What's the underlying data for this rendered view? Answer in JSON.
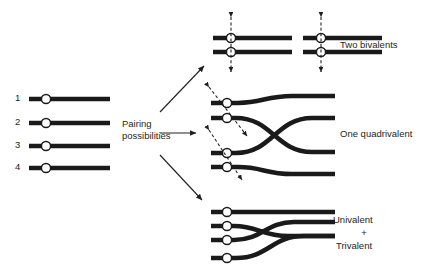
{
  "diagram": {
    "title_text_present": false,
    "background_color": "#ffffff",
    "chromosome_color": "#1a1a1a",
    "centromere_fill": "#ffffff",
    "arrow_color": "#231f20",
    "text_color": "#231f20"
  },
  "parent_set": {
    "name": "parental-chromosomes",
    "labels": [
      "1",
      "2",
      "3",
      "4"
    ]
  },
  "middle_label": {
    "line1": "Pairing",
    "line2": "possibilities"
  },
  "outcomes": [
    {
      "id": "two-bivalents",
      "label": "Two bivalents",
      "label_lines": [
        "Two bivalents"
      ],
      "arrow_direction": "up-right",
      "configuration": "two separate bivalents, each of two paired chromosomes",
      "motion_arrows": "vertical dashed double-headed arrows"
    },
    {
      "id": "one-quadrivalent",
      "label": "One quadrivalent",
      "label_lines": [
        "One quadrivalent"
      ],
      "arrow_direction": "right",
      "configuration": "four chromosomes joined, inner pair crossing in an X",
      "motion_arrows": "diagonal dashed double-headed arrows"
    },
    {
      "id": "univalent-trivalent",
      "label": "Univalent + Trivalent",
      "label_lines": [
        "Univalent",
        "+",
        "Trivalent"
      ],
      "arrow_direction": "down-right",
      "configuration": "one unpaired chromosome plus three associated chromosomes",
      "motion_arrows": "none"
    }
  ]
}
